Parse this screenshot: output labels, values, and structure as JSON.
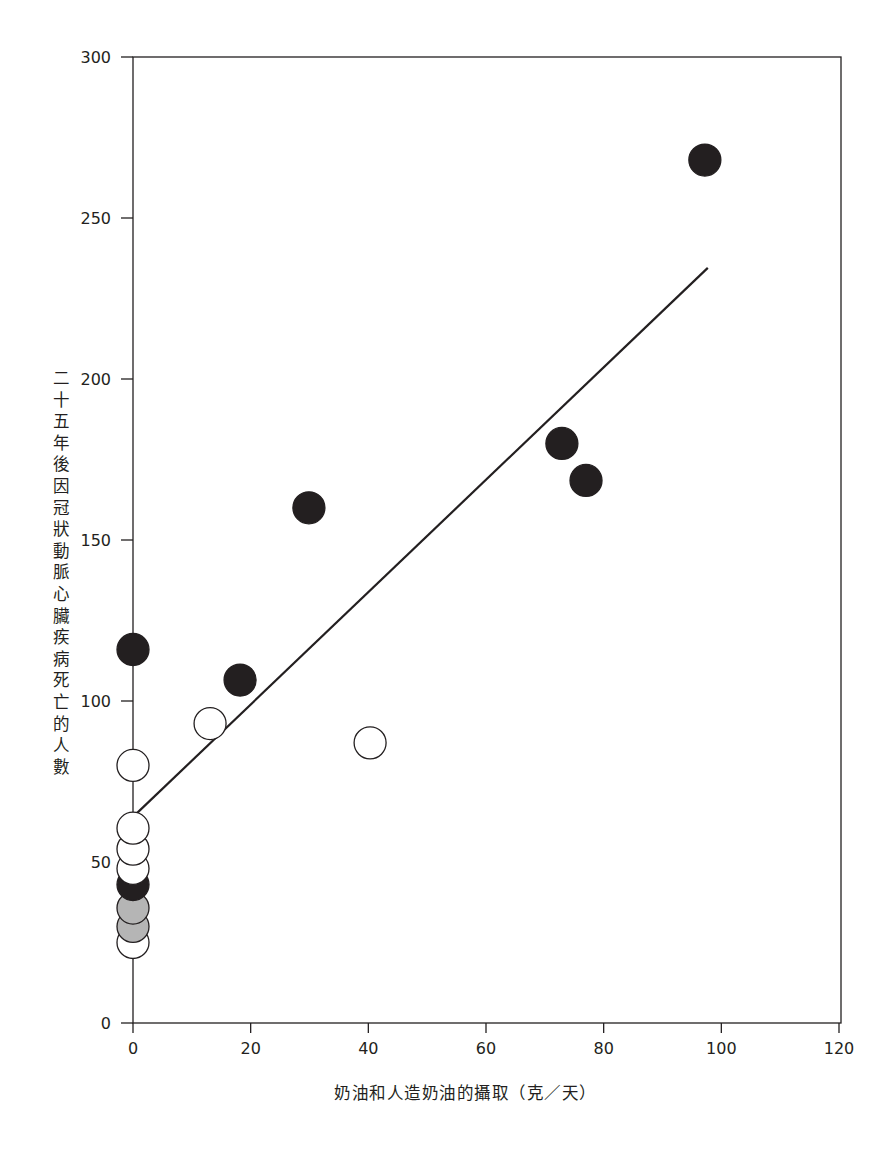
{
  "chart_data": {
    "type": "scatter",
    "title": "",
    "xlabel": "奶油和人造奶油的攝取（克／天）",
    "ylabel": "二十五年後因冠狀動脈心臟疾病死亡的人數",
    "xlim": [
      0,
      120
    ],
    "ylim": [
      0,
      300
    ],
    "x_ticks": [
      "0",
      "20",
      "40",
      "60",
      "80",
      "100",
      "120"
    ],
    "y_ticks": [
      "0",
      "50",
      "100",
      "150",
      "200",
      "250",
      "300"
    ],
    "grid": false,
    "legend": null,
    "frame": "box",
    "colors": {
      "black": "#231f20",
      "gray": "#b5b5b5",
      "open": "#ffffff",
      "axis": "#231f20"
    },
    "series": [
      {
        "name": "black",
        "marker_fill": "#231f20",
        "points": [
          {
            "x": 97.2,
            "y": 268
          },
          {
            "x": 72.9,
            "y": 180
          },
          {
            "x": 77.0,
            "y": 168.5
          },
          {
            "x": 29.9,
            "y": 160
          },
          {
            "x": 18.2,
            "y": 106.5
          },
          {
            "x": 0,
            "y": 116
          },
          {
            "x": 0,
            "y": 43
          }
        ]
      },
      {
        "name": "open",
        "marker_fill": "#ffffff",
        "points": [
          {
            "x": 13.1,
            "y": 93
          },
          {
            "x": 40.3,
            "y": 87
          },
          {
            "x": 0,
            "y": 80
          },
          {
            "x": 0,
            "y": 60.5
          },
          {
            "x": 0,
            "y": 54
          },
          {
            "x": 0,
            "y": 48
          },
          {
            "x": 0,
            "y": 25
          }
        ]
      },
      {
        "name": "gray",
        "marker_fill": "#b5b5b5",
        "points": [
          {
            "x": 0,
            "y": 35.7
          },
          {
            "x": 0,
            "y": 30
          }
        ]
      }
    ],
    "draw_order": [
      {
        "s": "black",
        "i": 0
      },
      {
        "s": "black",
        "i": 1
      },
      {
        "s": "black",
        "i": 2
      },
      {
        "s": "black",
        "i": 3
      },
      {
        "s": "black",
        "i": 4
      },
      {
        "s": "black",
        "i": 5
      },
      {
        "s": "open",
        "i": 0
      },
      {
        "s": "open",
        "i": 1
      },
      {
        "s": "open",
        "i": 2
      },
      {
        "s": "open",
        "i": 6
      },
      {
        "s": "gray",
        "i": 1
      },
      {
        "s": "gray",
        "i": 0
      },
      {
        "s": "black",
        "i": 6
      },
      {
        "s": "open",
        "i": 5
      },
      {
        "s": "open",
        "i": 4
      },
      {
        "s": "open",
        "i": 3
      }
    ],
    "trendline": {
      "x0": 0,
      "y0": 64,
      "x1": 97.7,
      "y1": 234.5
    }
  },
  "labels": {
    "xlabel": "奶油和人造奶油的攝取（克／天）",
    "ylabel": "二十五年後因冠狀動脈心臟疾病死亡的人數"
  }
}
